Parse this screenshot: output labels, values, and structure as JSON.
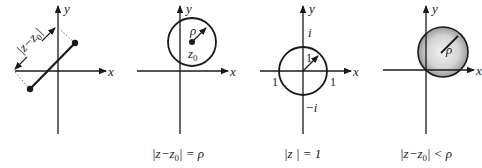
{
  "figure": {
    "panels": [
      {
        "id": "distance",
        "axis_labels": {
          "x": "x",
          "y": "y"
        },
        "annotation": "|z − z0|",
        "caption": ""
      },
      {
        "id": "circle",
        "axis_labels": {
          "x": "x",
          "y": "y"
        },
        "radius_label": "ρ",
        "center_label": "z",
        "center_subscript": "0",
        "caption_parts": {
          "pre": "|z−z",
          "sub": "0",
          "post": "| = ρ"
        }
      },
      {
        "id": "unit-circle",
        "axis_labels": {
          "x": "x",
          "y": "y"
        },
        "radius_label": "1",
        "tick_labels": {
          "top": "i",
          "bottom": "−i",
          "left": "1",
          "right": "1"
        },
        "caption": "|z | = 1"
      },
      {
        "id": "open-disk",
        "axis_labels": {
          "x": "x",
          "y": "y"
        },
        "radius_label": "ρ",
        "caption_parts": {
          "pre": "|z−z",
          "sub": "0",
          "post": "| < ρ"
        }
      }
    ],
    "colors": {
      "stroke": "#1a1a1a",
      "disk_fill_center": "#f2f2f2",
      "disk_fill_edge": "#9a9a9a"
    }
  }
}
